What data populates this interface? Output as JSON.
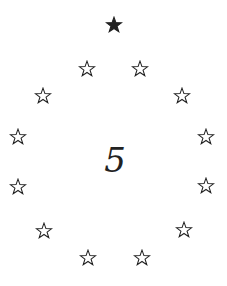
{
  "center_number": "5",
  "stars": [
    {
      "x": 114,
      "y": 25,
      "filled": true
    },
    {
      "x": 87,
      "y": 69,
      "filled": false
    },
    {
      "x": 140,
      "y": 69,
      "filled": false
    },
    {
      "x": 43,
      "y": 96,
      "filled": false
    },
    {
      "x": 182,
      "y": 96,
      "filled": false
    },
    {
      "x": 18,
      "y": 137,
      "filled": false
    },
    {
      "x": 206,
      "y": 137,
      "filled": false
    },
    {
      "x": 18,
      "y": 187,
      "filled": false
    },
    {
      "x": 206,
      "y": 186,
      "filled": false
    },
    {
      "x": 44,
      "y": 231,
      "filled": false
    },
    {
      "x": 184,
      "y": 230,
      "filled": false
    },
    {
      "x": 88,
      "y": 258,
      "filled": false
    },
    {
      "x": 142,
      "y": 258,
      "filled": false
    }
  ],
  "colors": {
    "star": "#222222",
    "background": "#ffffff"
  }
}
